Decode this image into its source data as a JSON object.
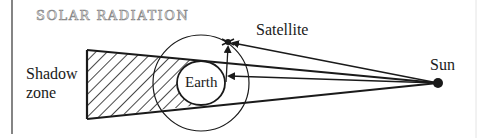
{
  "title": "SOLAR RADIATION",
  "labels": {
    "satellite": "Satellite",
    "sun": "Sun",
    "shadow_line1": "Shadow",
    "shadow_line2": "zone",
    "earth": "Earth"
  },
  "colors": {
    "ink": "#1a1a1a",
    "title_outline": "#8a8a8a",
    "background": "#ffffff"
  },
  "elements": {
    "sun": {
      "cx": 438,
      "cy": 83,
      "r": 5
    },
    "earth": {
      "cx": 201,
      "cy": 83,
      "rx": 24,
      "ry": 22
    },
    "orbit": {
      "cx": 201,
      "cy": 83,
      "r": 48
    },
    "satellite": {
      "x": 228,
      "y": 42
    },
    "shadow_zone": {
      "left_top": [
        87,
        50
      ],
      "left_bottom": [
        87,
        119
      ]
    }
  }
}
